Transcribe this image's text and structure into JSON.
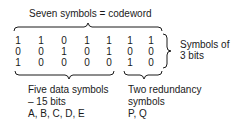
{
  "title": "Seven symbols = codeword",
  "matrix": {
    "rows": [
      [
        "1",
        "1",
        "0",
        "1",
        "1",
        "1",
        "1"
      ],
      [
        "0",
        "0",
        "1",
        "0",
        "1",
        "0",
        "0"
      ],
      [
        "1",
        "0",
        "0",
        "0",
        "0",
        "1",
        "0"
      ]
    ]
  },
  "right_label": [
    "Symbols of",
    "3 bits"
  ],
  "data_group": {
    "lines": [
      "Five data symbols",
      "– 15 bits",
      "A, B, C, D, E"
    ]
  },
  "redundancy_group": {
    "lines": [
      "Two redundancy",
      "symbols",
      "P, Q"
    ]
  }
}
